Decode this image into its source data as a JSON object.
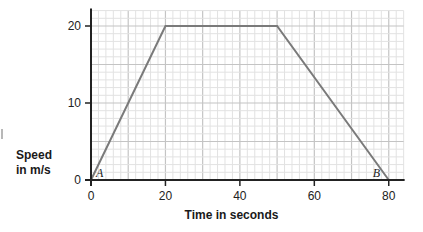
{
  "chart_data": {
    "type": "line",
    "title": "",
    "xlabel": "Time in seconds",
    "ylabel": "Speed in m/s",
    "ylabel_lines": [
      "Speed",
      "in m/s"
    ],
    "x": [
      0,
      20,
      50,
      80
    ],
    "series": [
      {
        "name": "speed",
        "values": [
          0,
          20,
          20,
          0
        ],
        "color": "#7a7a7a"
      }
    ],
    "xlim": [
      0,
      84
    ],
    "ylim": [
      0,
      22
    ],
    "x_ticks": [
      0,
      20,
      40,
      60,
      80
    ],
    "x_tick_labels": [
      "0",
      "20",
      "40",
      "60",
      "80"
    ],
    "y_ticks": [
      0,
      10,
      20
    ],
    "y_tick_labels": [
      "0",
      "10",
      "20"
    ],
    "grid": {
      "on": true,
      "minor_x_step": 2,
      "minor_y_step": 1,
      "major_x_step": 10,
      "major_y_step": 5
    },
    "annotations": [
      {
        "text": "A",
        "x": 0,
        "y": 0,
        "style": "italic serif"
      },
      {
        "text": "B",
        "x": 80,
        "y": 0,
        "style": "italic serif"
      }
    ],
    "legend": null
  },
  "colors": {
    "axis": "#222222",
    "line": "#7a7a7a",
    "grid_minor": "#e2e2e2",
    "grid_major": "#c4c4c4",
    "background": "#ffffff"
  }
}
